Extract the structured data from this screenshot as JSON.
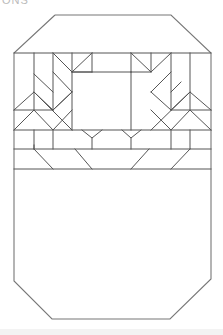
{
  "cropped_header_text": "ONS",
  "colors": {
    "line": "#555555",
    "outline": "#777777",
    "background": "#ffffff"
  },
  "sections": [
    "patterned-top-band",
    "plain-lower-panel"
  ]
}
